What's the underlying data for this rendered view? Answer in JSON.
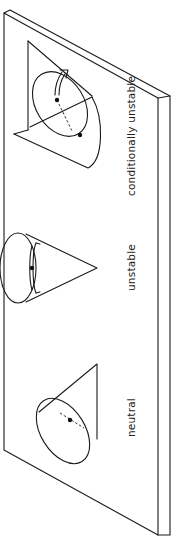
{
  "figure": {
    "orientation": "rotated 90 degrees counter-clockwise",
    "colors": {
      "line": "#1a1a1a",
      "background": "#ffffff",
      "text": "#222222"
    },
    "panels": [
      {
        "id": "conditionally-unstable",
        "label": "conditionally unstable"
      },
      {
        "id": "unstable",
        "label": "unstable"
      },
      {
        "id": "neutral",
        "label": "neutral"
      }
    ]
  }
}
